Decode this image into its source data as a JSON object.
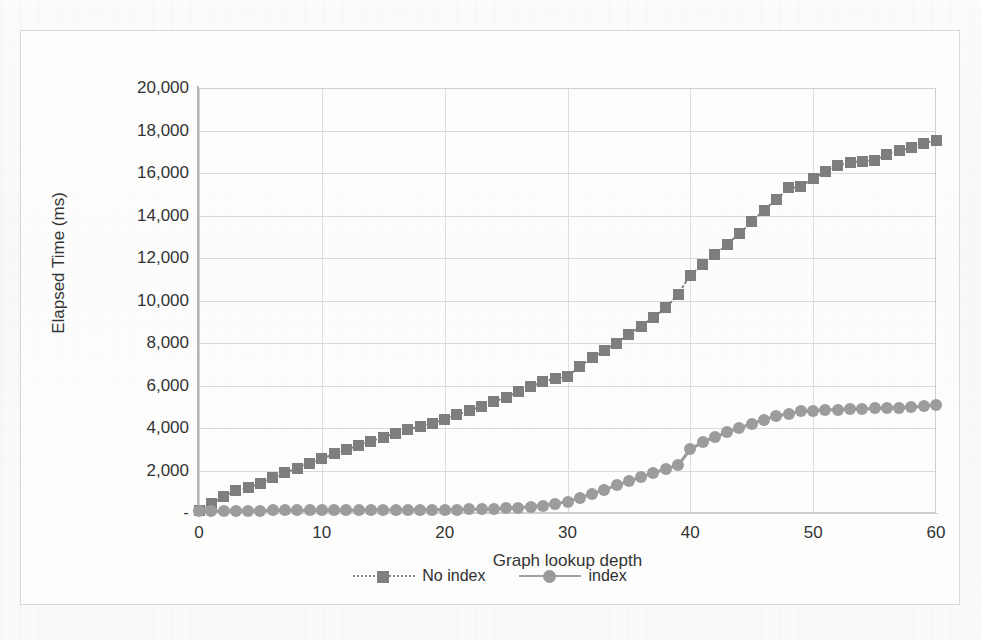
{
  "chart_data": {
    "type": "line",
    "title": "",
    "xlabel": "Graph lookup depth",
    "ylabel": "Elapsed Time (ms)",
    "xlim": [
      0,
      60
    ],
    "ylim": [
      0,
      20000
    ],
    "grid": true,
    "legend_position": "bottom",
    "x_ticks": [
      "0",
      "10",
      "20",
      "30",
      "40",
      "50",
      "60"
    ],
    "x_tick_values": [
      0,
      10,
      20,
      30,
      40,
      50,
      60
    ],
    "y_ticks": [
      "-",
      "2,000",
      "4,000",
      "6,000",
      "8,000",
      "10,000",
      "12,000",
      "14,000",
      "16,000",
      "18,000",
      "20,000"
    ],
    "y_tick_values": [
      0,
      2000,
      4000,
      6000,
      8000,
      10000,
      12000,
      14000,
      16000,
      18000,
      20000
    ],
    "x": [
      0,
      1,
      2,
      3,
      4,
      5,
      6,
      7,
      8,
      9,
      10,
      11,
      12,
      13,
      14,
      15,
      16,
      17,
      18,
      19,
      20,
      21,
      22,
      23,
      24,
      25,
      26,
      27,
      28,
      29,
      30,
      31,
      32,
      33,
      34,
      35,
      36,
      37,
      38,
      39,
      40,
      41,
      42,
      43,
      44,
      45,
      46,
      47,
      48,
      49,
      50,
      51,
      52,
      53,
      54,
      55,
      56,
      57,
      58,
      59,
      60
    ],
    "series": [
      {
        "name": "No index",
        "marker": "square",
        "line_style": "dotted",
        "color": "#7e7e7e",
        "values": [
          120,
          430,
          760,
          1080,
          1180,
          1400,
          1650,
          1900,
          2100,
          2350,
          2550,
          2780,
          2980,
          3180,
          3380,
          3560,
          3750,
          3930,
          4080,
          4230,
          4400,
          4620,
          4820,
          5020,
          5230,
          5450,
          5700,
          5950,
          6180,
          6320,
          6420,
          6900,
          7300,
          7650,
          8000,
          8400,
          8800,
          9200,
          9650,
          10300,
          11200,
          11700,
          12150,
          12650,
          13150,
          13700,
          14250,
          14750,
          15300,
          15350,
          15750,
          16050,
          16350,
          16500,
          16550,
          16600,
          16850,
          17050,
          17200,
          17400,
          17550
        ]
      },
      {
        "name": "index",
        "marker": "circle",
        "line_style": "solid",
        "color": "#9c9c9c",
        "values": [
          90,
          95,
          100,
          105,
          110,
          115,
          118,
          120,
          122,
          125,
          128,
          130,
          132,
          135,
          138,
          140,
          143,
          145,
          148,
          150,
          155,
          160,
          170,
          180,
          195,
          215,
          245,
          290,
          350,
          430,
          540,
          700,
          900,
          1100,
          1300,
          1500,
          1700,
          1880,
          2070,
          2250,
          3000,
          3320,
          3580,
          3800,
          4000,
          4200,
          4400,
          4550,
          4680,
          4780,
          4820,
          4850,
          4870,
          4890,
          4900,
          4920,
          4930,
          4950,
          4980,
          5020,
          5080
        ]
      }
    ],
    "legend": [
      {
        "label": "No index",
        "marker": "square",
        "line_style": "dotted"
      },
      {
        "label": "index",
        "marker": "circle",
        "line_style": "solid"
      }
    ]
  }
}
